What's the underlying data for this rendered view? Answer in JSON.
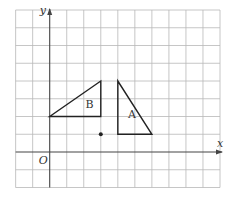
{
  "diagram": {
    "grid": {
      "x_min": -2,
      "x_max": 10,
      "y_min": -2,
      "y_max": 8,
      "origin_px": [
        49.7,
        152.0
      ],
      "unit_px": [
        17.03,
        17.75
      ],
      "line_color": "#b8b8b8",
      "axis_color": "#444444"
    },
    "axes": {
      "x_label": "x",
      "y_label": "y",
      "origin_label": "O"
    },
    "shapes": [
      {
        "id": "B",
        "label": "B",
        "vertices": [
          [
            0,
            2
          ],
          [
            3,
            2
          ],
          [
            3,
            4
          ]
        ],
        "label_pos": [
          2.1,
          2.5
        ]
      },
      {
        "id": "A",
        "label": "A",
        "vertices": [
          [
            4,
            1
          ],
          [
            6,
            1
          ],
          [
            4,
            4
          ]
        ],
        "label_pos": [
          4.6,
          1.9
        ]
      }
    ],
    "points": [
      {
        "id": "center",
        "coords": [
          3,
          1
        ]
      }
    ],
    "stroke_color": "#222222"
  }
}
